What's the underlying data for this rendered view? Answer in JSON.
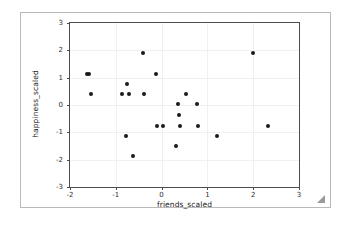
{
  "figure": {
    "resize_grip_icon": "resize-grip-icon",
    "background_color": "#ffffff",
    "frame_color": "#b9b9b9"
  },
  "chart_data": {
    "type": "scatter",
    "title": "",
    "xlabel": "friends_scaled",
    "ylabel": "happiness_scaled",
    "xlim": [
      -2,
      3
    ],
    "ylim": [
      -3,
      3
    ],
    "xticks": [
      -2,
      -1,
      0,
      1,
      2,
      3
    ],
    "yticks": [
      -3,
      -2,
      -1,
      0,
      1,
      2,
      3
    ],
    "xticklabels": [
      "-2",
      "-1",
      "0",
      "1",
      "2",
      "3"
    ],
    "yticklabels": [
      "-3",
      "-2",
      "-1",
      "0",
      "1",
      "2",
      "3"
    ],
    "grid": true,
    "legend": null,
    "marker_color": "#1a1a1a",
    "marker_size": 4,
    "points": [
      {
        "x": -1.62,
        "y": 1.15
      },
      {
        "x": -1.58,
        "y": 1.15
      },
      {
        "x": -1.55,
        "y": 0.4
      },
      {
        "x": -0.87,
        "y": 0.4
      },
      {
        "x": -0.75,
        "y": 0.78
      },
      {
        "x": -0.72,
        "y": 0.4
      },
      {
        "x": -0.78,
        "y": -1.12
      },
      {
        "x": -0.63,
        "y": -1.88
      },
      {
        "x": -0.4,
        "y": 1.92
      },
      {
        "x": -0.38,
        "y": 0.4
      },
      {
        "x": -0.12,
        "y": 1.15
      },
      {
        "x": -0.1,
        "y": -0.75
      },
      {
        "x": 0.03,
        "y": -0.75
      },
      {
        "x": 0.32,
        "y": -1.5
      },
      {
        "x": 0.35,
        "y": 0.03
      },
      {
        "x": 0.37,
        "y": -0.35
      },
      {
        "x": 0.4,
        "y": -0.75
      },
      {
        "x": 0.53,
        "y": 0.4
      },
      {
        "x": 0.78,
        "y": 0.03
      },
      {
        "x": 0.8,
        "y": -0.75
      },
      {
        "x": 1.22,
        "y": -1.12
      },
      {
        "x": 2.0,
        "y": 1.92
      },
      {
        "x": 2.32,
        "y": -0.75
      }
    ]
  }
}
